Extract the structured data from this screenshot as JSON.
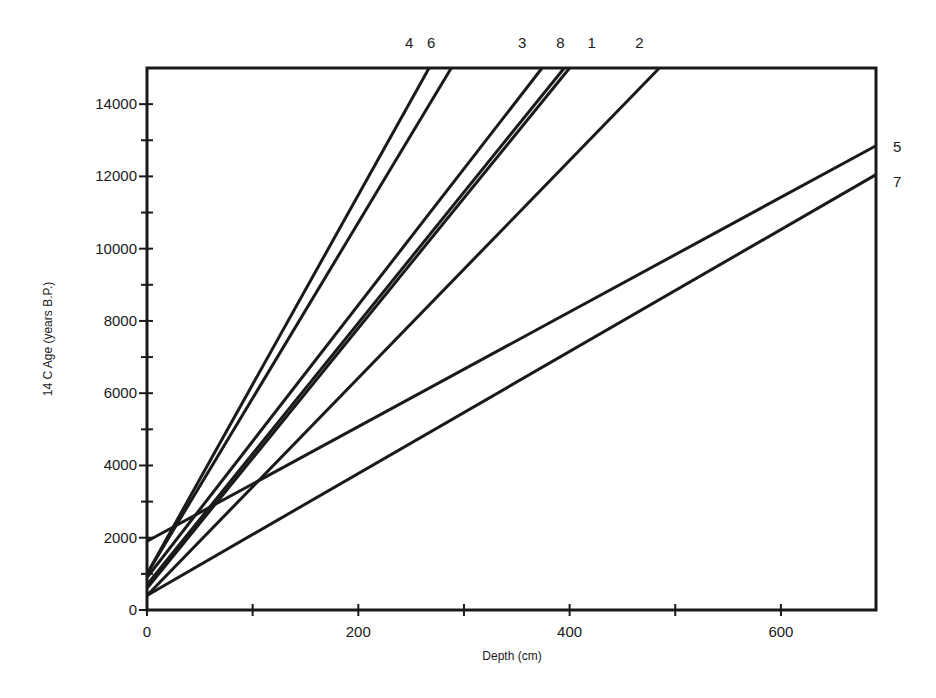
{
  "chart_data": {
    "type": "line",
    "title": "",
    "xlabel": "Depth (cm)",
    "ylabel": "14 C Age (years B.P.)",
    "xlim": [
      0,
      690
    ],
    "ylim": [
      0,
      15000
    ],
    "grid": false,
    "legend_position": "inline line-end labels (top and right)",
    "x_ticks": [
      0,
      100,
      200,
      300,
      400,
      500,
      600
    ],
    "x_tick_labels": [
      "0",
      "",
      "200",
      "",
      "400",
      "",
      "600"
    ],
    "y_ticks": [
      0,
      1000,
      2000,
      3000,
      4000,
      5000,
      6000,
      7000,
      8000,
      9000,
      10000,
      11000,
      12000,
      13000,
      14000
    ],
    "y_tick_labels": [
      "0",
      "",
      "2000",
      "",
      "4000",
      "",
      "6000",
      "",
      "8000",
      "",
      "10000",
      "",
      "12000",
      "",
      "14000"
    ],
    "series": [
      {
        "name": "1",
        "x": [
          0,
          400
        ],
        "y": [
          600,
          15000
        ],
        "label_pos": "top"
      },
      {
        "name": "2",
        "x": [
          0,
          485
        ],
        "y": [
          400,
          15000
        ],
        "label_pos": "top"
      },
      {
        "name": "3",
        "x": [
          0,
          374
        ],
        "y": [
          900,
          15000
        ],
        "label_pos": "top"
      },
      {
        "name": "4",
        "x": [
          0,
          267
        ],
        "y": [
          1000,
          15000
        ],
        "label_pos": "top"
      },
      {
        "name": "5",
        "x": [
          0,
          690
        ],
        "y": [
          1900,
          12850
        ],
        "label_pos": "right"
      },
      {
        "name": "6",
        "x": [
          0,
          288
        ],
        "y": [
          1000,
          15000
        ],
        "label_pos": "top"
      },
      {
        "name": "7",
        "x": [
          0,
          690
        ],
        "y": [
          400,
          12050
        ],
        "label_pos": "right"
      },
      {
        "name": "8",
        "x": [
          0,
          395
        ],
        "y": [
          700,
          15000
        ],
        "label_pos": "top"
      }
    ],
    "color": "#1a1a1a"
  }
}
